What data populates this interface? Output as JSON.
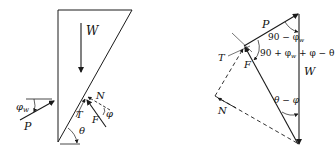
{
  "figures": {
    "left": {
      "title": "Wedge free-body diagram",
      "labels": {
        "W": "W",
        "P": "P",
        "phi_w": "φ",
        "phi_w_sub": "w",
        "N": "N",
        "T": "T",
        "F": "F",
        "phi": "φ",
        "theta": "θ"
      }
    },
    "right": {
      "title": "Force polygon",
      "labels": {
        "P": "P",
        "T": "T",
        "F": "F",
        "W": "W",
        "N": "N",
        "angle_top_prefix": "90 − φ",
        "angle_top_sub": "w",
        "angle_mid_prefix": "90 + φ",
        "angle_mid_sub": "w",
        "angle_mid_suffix": " + φ − θ",
        "angle_bottom": "θ − φ"
      }
    }
  },
  "colors": {
    "line": "#1a1a1a",
    "background": "#ffffff"
  }
}
